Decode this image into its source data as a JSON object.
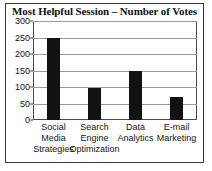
{
  "chart_data": {
    "type": "bar",
    "title": "Most Helpful Session – Number of Votes",
    "xlabel": "",
    "ylabel": "",
    "ylim": [
      0,
      300
    ],
    "ytick_step": 50,
    "yticks": [
      "0",
      "50",
      "100",
      "150",
      "200",
      "250",
      "300"
    ],
    "grid": true,
    "legend": "none",
    "bar_color": "#121212",
    "categories": [
      "Social Media Strategies",
      "Search Engine Optimization",
      "Data Analytics",
      "E-mail Marketing"
    ],
    "category_lines": [
      [
        "Social",
        "Media",
        "Strategies"
      ],
      [
        "Search",
        "Engine",
        "Optimization"
      ],
      [
        "Data",
        "Analytics",
        ""
      ],
      [
        "E-mail",
        "Marketing",
        ""
      ]
    ],
    "values": [
      250,
      97,
      148,
      70
    ]
  },
  "figure": {
    "border_color": "#3a3a3a",
    "background": "#ffffff",
    "axis_color": "#4a4a4a",
    "gridline_color": "#9a9a9a"
  }
}
